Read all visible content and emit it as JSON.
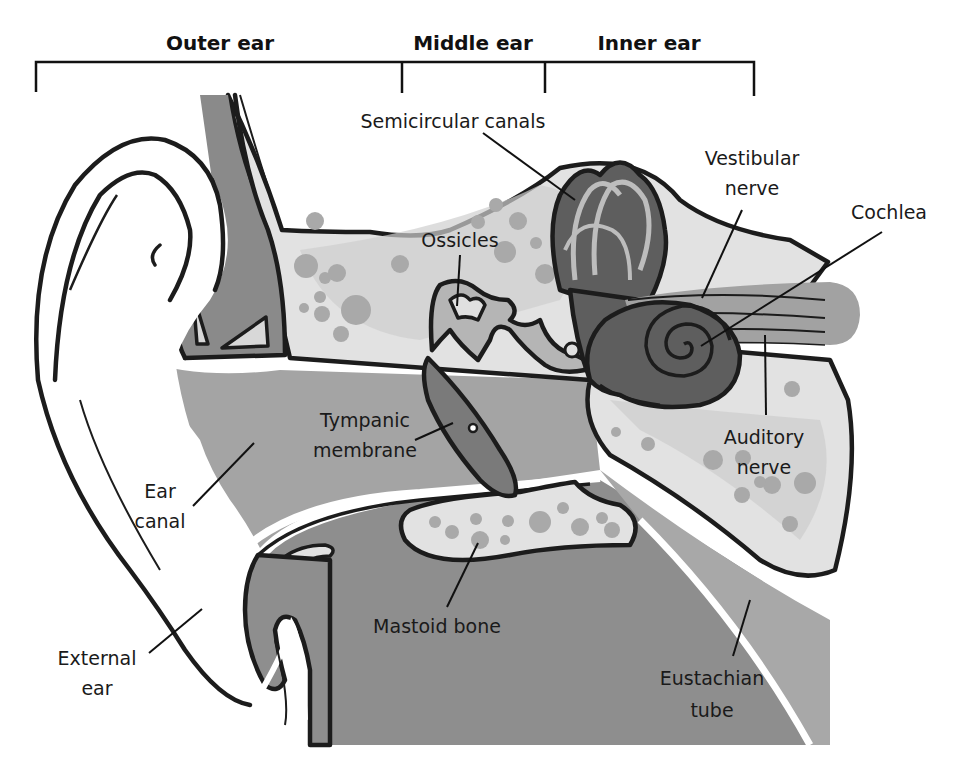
{
  "sections": {
    "outer": "Outer ear",
    "middle": "Middle ear",
    "inner": "Inner ear"
  },
  "labels": {
    "semicircular_canals": "Semicircular canals",
    "vestibular_nerve_1": "Vestibular",
    "vestibular_nerve_2": "nerve",
    "cochlea": "Cochlea",
    "ossicles": "Ossicles",
    "tympanic_membrane_1": "Tympanic",
    "tympanic_membrane_2": "membrane",
    "auditory_nerve_1": "Auditory",
    "auditory_nerve_2": "nerve",
    "ear_canal_1": "Ear",
    "ear_canal_2": "canal",
    "mastoid_bone": "Mastoid bone",
    "external_ear_1": "External",
    "external_ear_2": "ear",
    "eustachian_tube_1": "Eustachian",
    "eustachian_tube_2": "tube"
  },
  "colors": {
    "background": "#ffffff",
    "outline": "#1c1c1c",
    "light_bone": "#e2e2e2",
    "bone_spots": "#a9a9a9",
    "mid_gray": "#a6a6a6",
    "tissue_gray": "#8c8c8c",
    "dark_organ": "#5e5e5e",
    "cartilage": "#8a8a8a"
  }
}
